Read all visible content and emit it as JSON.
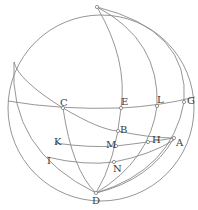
{
  "diagram": {
    "type": "spherical-geometry-figure",
    "sphere": {
      "cx": 101,
      "cy": 108,
      "r": 93
    },
    "labels": {
      "C": "C",
      "E": "E",
      "L": "L",
      "G": "G",
      "B": "B",
      "H": "H",
      "A": "A",
      "M": "M",
      "K": "K",
      "I": "I",
      "N": "N",
      "D": "D"
    },
    "points": [
      {
        "id": "pole",
        "x": 97,
        "y": 7
      },
      {
        "id": "C",
        "x": 63,
        "y": 108
      },
      {
        "id": "E",
        "x": 121,
        "y": 108
      },
      {
        "id": "L",
        "x": 157,
        "y": 106
      },
      {
        "id": "G",
        "x": 184,
        "y": 102
      },
      {
        "id": "B",
        "x": 118,
        "y": 131
      },
      {
        "id": "H",
        "x": 148,
        "y": 142
      },
      {
        "id": "A",
        "x": 174,
        "y": 138
      },
      {
        "id": "M",
        "x": 116,
        "y": 146
      },
      {
        "id": "N",
        "x": 114,
        "y": 162
      },
      {
        "id": "D",
        "x": 96,
        "y": 193
      }
    ],
    "stroke_color": "#8a8a8a",
    "background": "#ffffff"
  }
}
